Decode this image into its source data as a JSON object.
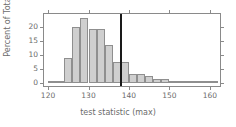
{
  "chart_data": {
    "type": "bar",
    "title": "",
    "subtitle": "",
    "xlabel": "test statistic (max)",
    "ylabel": "Percent of Total",
    "xlim": [
      119.0,
      162.5
    ],
    "ylim": [
      -1.2,
      24.5
    ],
    "grid": false,
    "legend": null,
    "x_ticks": [
      120,
      130,
      140,
      150,
      160
    ],
    "y_ticks": [
      0,
      5,
      10,
      15,
      20
    ],
    "bin_width": 2,
    "bar_fill_color": "#cfcfcf",
    "bar_border_color": "#8f8f8f",
    "frame_color": "#8a8a8a",
    "text_color": "#6b6b6b",
    "annotations": [
      {
        "name": "observed-statistic-line",
        "type": "vline",
        "x": 138,
        "color": "#1a1a1a",
        "width": 2
      }
    ],
    "bins": [
      {
        "x0": 120,
        "x1": 122,
        "value": 0.6
      },
      {
        "x0": 122,
        "x1": 124,
        "value": 0.6
      },
      {
        "x0": 124,
        "x1": 126,
        "value": 8.8
      },
      {
        "x0": 126,
        "x1": 128,
        "value": 20.0
      },
      {
        "x0": 128,
        "x1": 130,
        "value": 23.1
      },
      {
        "x0": 130,
        "x1": 132,
        "value": 19.0
      },
      {
        "x0": 132,
        "x1": 134,
        "value": 19.0
      },
      {
        "x0": 134,
        "x1": 136,
        "value": 13.5
      },
      {
        "x0": 136,
        "x1": 138,
        "value": 7.5
      },
      {
        "x0": 138,
        "x1": 140,
        "value": 7.5
      },
      {
        "x0": 140,
        "x1": 142,
        "value": 3.0
      },
      {
        "x0": 142,
        "x1": 144,
        "value": 3.0
      },
      {
        "x0": 144,
        "x1": 146,
        "value": 2.3
      },
      {
        "x0": 146,
        "x1": 148,
        "value": 1.2
      },
      {
        "x0": 148,
        "x1": 150,
        "value": 1.2
      },
      {
        "x0": 150,
        "x1": 152,
        "value": 0.6
      },
      {
        "x0": 152,
        "x1": 154,
        "value": 0.3
      },
      {
        "x0": 154,
        "x1": 156,
        "value": 0.2
      },
      {
        "x0": 156,
        "x1": 158,
        "value": 0.2
      },
      {
        "x0": 158,
        "x1": 160,
        "value": 0.2
      },
      {
        "x0": 160,
        "x1": 162,
        "value": 0.2
      }
    ],
    "categories": [
      "120-122",
      "122-124",
      "124-126",
      "126-128",
      "128-130",
      "130-132",
      "132-134",
      "134-136",
      "136-138",
      "138-140",
      "140-142",
      "142-144",
      "144-146",
      "146-148",
      "148-150",
      "150-152",
      "152-154",
      "154-156",
      "156-158",
      "158-160",
      "160-162"
    ],
    "values": [
      0.6,
      0.6,
      8.8,
      20.0,
      23.1,
      19.0,
      19.0,
      13.5,
      7.5,
      7.5,
      3.0,
      3.0,
      2.3,
      1.2,
      1.2,
      0.6,
      0.3,
      0.2,
      0.2,
      0.2,
      0.2
    ]
  }
}
